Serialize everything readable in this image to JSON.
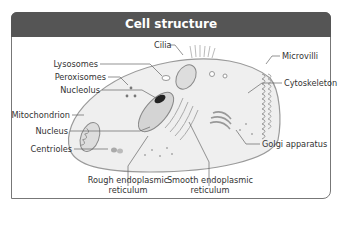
{
  "title": "Cell structure",
  "colors": {
    "header_bg": "#555555",
    "header_text": "#ffffff",
    "frame_border": "#777777",
    "cell_fill": "#f0f0f0",
    "organelle_stroke": "#888888",
    "label_text": "#333333"
  },
  "labels": {
    "cilia": "Cilia",
    "lysosomes": "Lysosomes",
    "peroxisomes": "Peroxisomes",
    "nucleolus": "Nucleolus",
    "mitochondrion": "Mitochondrion",
    "nucleus": "Nucleus",
    "centrioles": "Centrioles",
    "rough_er_line1": "Rough endoplasmic",
    "rough_er_line2": "reticulum",
    "smooth_er_line1": "Smooth endoplasmic",
    "smooth_er_line2": "reticulum",
    "golgi": "Golgi apparatus",
    "cytoskeleton": "Cytoskeleton",
    "microvilli": "Microvilli"
  }
}
